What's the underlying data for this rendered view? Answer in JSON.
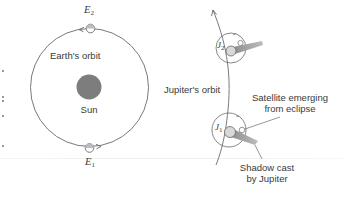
{
  "diagram": {
    "colors": {
      "line": "#6a6a6a",
      "sun": "#7d7d7d",
      "planet_fill": "#d8d8d8",
      "shadow": "#9a9a9a",
      "text": "#3a3a3a"
    },
    "earth": {
      "orbit_label": "Earth's orbit",
      "positions": [
        {
          "id": "E2",
          "letter": "E",
          "subscript": "2"
        },
        {
          "id": "E1",
          "letter": "E",
          "subscript": "1"
        }
      ]
    },
    "sun": {
      "label": "Sun"
    },
    "jupiter": {
      "orbit_label": "Jupiter's orbit",
      "positions": [
        {
          "id": "J2",
          "letter": "J",
          "subscript": "2"
        },
        {
          "id": "J1",
          "letter": "J",
          "subscript": "1"
        }
      ]
    },
    "annotations": {
      "satellite": [
        "Satellite emerging",
        "from eclipse"
      ],
      "shadow": [
        "Shadow cast",
        "by Jupiter"
      ]
    }
  }
}
